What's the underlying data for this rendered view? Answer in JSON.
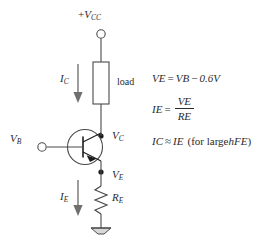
{
  "diagram": {
    "supply": {
      "label_prefix": "+",
      "label_var": "V",
      "label_sub": "CC",
      "terminal": "open-circle"
    },
    "load": {
      "label": "load"
    },
    "currents": {
      "collector": {
        "var": "I",
        "sub": "C"
      },
      "emitter": {
        "var": "I",
        "sub": "E"
      }
    },
    "nodes": {
      "collector": {
        "var": "V",
        "sub": "C"
      },
      "base": {
        "var": "V",
        "sub": "B"
      },
      "emitter": {
        "var": "V",
        "sub": "E"
      }
    },
    "emitter_resistor": {
      "var": "R",
      "sub": "E"
    },
    "ground": "ground-symbol"
  },
  "equations": {
    "eq1": {
      "lhs_var": "V",
      "lhs_sub": "E",
      "equals": "=",
      "rhs_var": "V",
      "rhs_sub": "B",
      "minus": "−",
      "value": "0.6V"
    },
    "eq2": {
      "lhs_var": "I",
      "lhs_sub": "E",
      "equals": "=",
      "num_var": "V",
      "num_sub": "E",
      "den_var": "R",
      "den_sub": "E"
    },
    "eq3": {
      "lhs_var": "I",
      "lhs_sub": "C",
      "approx": "≈",
      "rhs_var": "I",
      "rhs_sub": "E",
      "note_open": "(for large ",
      "note_var": "h",
      "note_sub": "FE",
      "note_close": ")"
    }
  },
  "colors": {
    "wire": "#4a4a4a",
    "text": "#2b2b2b",
    "arrow": "#8c8c8c",
    "background": "#ffffff"
  }
}
